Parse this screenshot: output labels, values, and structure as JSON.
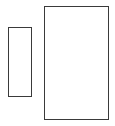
{
  "diagram": {
    "shapes": [
      {
        "id": "rect-small",
        "type": "rectangle",
        "stroke": "#3a3a3a",
        "fill": "#ffffff"
      },
      {
        "id": "rect-large",
        "type": "rectangle",
        "stroke": "#3a3a3a",
        "fill": "#ffffff"
      }
    ]
  }
}
